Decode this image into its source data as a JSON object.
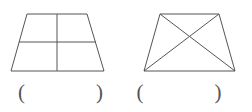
{
  "page": {
    "background_color": "#ffffff",
    "stroke_color": "#54545a",
    "width": 251,
    "height": 112
  },
  "figures": [
    {
      "id": "figure-left",
      "shape_name": "trapezoid-divided-into-four-parts",
      "description": "Trapezoid divided by one vertical and one horizontal midline into four regions",
      "outline_points": "27,14 87,14 104,71 11,71",
      "inner_lines": [
        {
          "name": "vertical-midline",
          "x1": 57,
          "y1": 14,
          "x2": 57,
          "y2": 71
        },
        {
          "name": "horizontal-midline",
          "x1": 19,
          "y1": 42,
          "x2": 96,
          "y2": 42
        }
      ]
    },
    {
      "id": "figure-right",
      "shape_name": "trapezoid-with-diagonals",
      "description": "Trapezoid with both diagonals drawn forming an X",
      "outline_points": "160,14 219,14 235,71 144,71",
      "inner_lines": [
        {
          "name": "diagonal-top-left-to-bottom-right",
          "x1": 160,
          "y1": 14,
          "x2": 235,
          "y2": 71
        },
        {
          "name": "diagonal-top-right-to-bottom-left",
          "x1": 219,
          "y1": 14,
          "x2": 144,
          "y2": 71
        }
      ]
    }
  ],
  "answers": [
    {
      "id": "answer-left",
      "paren_open": "(",
      "paren_close": ")",
      "value": "",
      "placeholder": ""
    },
    {
      "id": "answer-right",
      "paren_open": "(",
      "paren_close": ")",
      "value": "",
      "placeholder": ""
    }
  ]
}
